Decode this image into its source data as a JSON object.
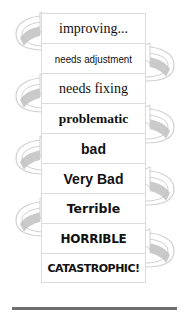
{
  "diagram": {
    "type": "stacked-scale-with-cycling-arrows",
    "levels": [
      {
        "label": "improving...",
        "arrow_side": "left"
      },
      {
        "label": "needs adjustment",
        "arrow_side": "right"
      },
      {
        "label": "needs fixing",
        "arrow_side": "left"
      },
      {
        "label": "problematic",
        "arrow_side": "right"
      },
      {
        "label": "bad",
        "arrow_side": "left"
      },
      {
        "label": "Very Bad",
        "arrow_side": "right"
      },
      {
        "label": "Terrible",
        "arrow_side": "left"
      },
      {
        "label": "HORRIBLE",
        "arrow_side": "right"
      },
      {
        "label": "CATASTROPHIC!",
        "arrow_side": "none"
      }
    ],
    "colors": {
      "text": "#111111",
      "box_border": "#dcdcdc",
      "arrow_outline": "#d0d0d0",
      "arrow_shade": "#bdbdbd",
      "rule": "#6e6e6e"
    }
  }
}
